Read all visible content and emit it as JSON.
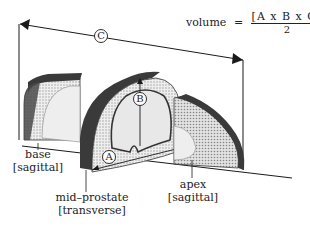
{
  "formula": {
    "lhs": "volume",
    "equals": "=",
    "numerator": "[A x B x C]",
    "denominator": "2"
  },
  "dimensions": {
    "a": "A",
    "b": "B",
    "c": "C"
  },
  "labels": {
    "base_line1": "base",
    "base_line2": "[sagittal]",
    "mid_line1": "mid–prostate",
    "mid_line2": "[transverse]",
    "apex_line1": "apex",
    "apex_line2": "[sagittal]"
  },
  "colors": {
    "capsule": "#3a3a3a",
    "parenchyma": "#d8d8d8",
    "line": "#1a1a1a"
  }
}
